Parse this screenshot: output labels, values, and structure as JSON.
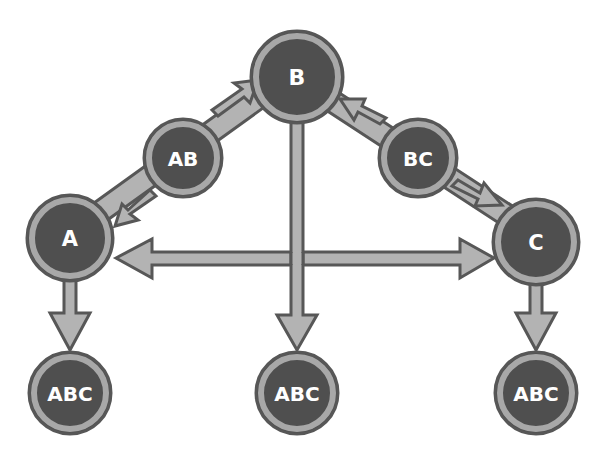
{
  "diagram": {
    "type": "directed-graph",
    "colors": {
      "node_fill": "#4f4f4f",
      "node_ring": "#a8a8a8",
      "outline": "#575757",
      "arrow_fill": "#b3b3b3",
      "label": "#ffffff",
      "background": "#ffffff"
    },
    "nodes": [
      {
        "id": "B",
        "label": "B",
        "cx": 297,
        "cy": 77,
        "r": 46
      },
      {
        "id": "AB",
        "label": "AB",
        "cx": 183,
        "cy": 158,
        "r": 39
      },
      {
        "id": "BC",
        "label": "BC",
        "cx": 418,
        "cy": 158,
        "r": 39
      },
      {
        "id": "A",
        "label": "A",
        "cx": 70,
        "cy": 238,
        "r": 43
      },
      {
        "id": "C",
        "label": "C",
        "cx": 536,
        "cy": 242,
        "r": 43
      },
      {
        "id": "ABC1",
        "label": "ABC",
        "cx": 70,
        "cy": 393,
        "r": 41
      },
      {
        "id": "ABC2",
        "label": "ABC",
        "cx": 297,
        "cy": 393,
        "r": 41
      },
      {
        "id": "ABC3",
        "label": "ABC",
        "cx": 536,
        "cy": 393,
        "r": 41
      }
    ],
    "edges": [
      {
        "from": "A",
        "to": "B",
        "via": "AB",
        "note": "A-AB-B connector with arrow into B"
      },
      {
        "from": "B",
        "to": "A",
        "via": "AB",
        "note": "arrow into A"
      },
      {
        "from": "C",
        "to": "B",
        "via": "BC",
        "note": "arrow into B"
      },
      {
        "from": "B",
        "to": "C",
        "via": "BC",
        "note": "arrow into C"
      },
      {
        "from": "A",
        "to": "C",
        "bidirectional": true
      },
      {
        "from": "A",
        "to": "ABC1"
      },
      {
        "from": "B",
        "to": "ABC2"
      },
      {
        "from": "C",
        "to": "ABC3"
      }
    ]
  }
}
